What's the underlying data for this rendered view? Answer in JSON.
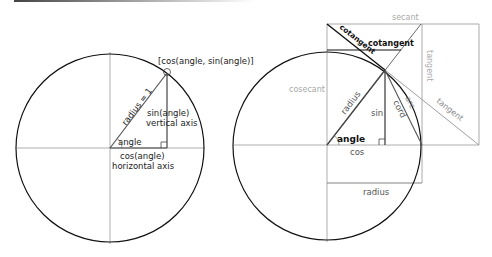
{
  "header": {
    "rule_gradient_start": "#444444",
    "rule_gradient_end": "#ffffff"
  },
  "left_diagram": {
    "labels": {
      "point": "[cos(angle, sin(angle)]",
      "radius": "radius = 1",
      "sin_line1": "sin(angle)",
      "sin_line2": "vertical axis",
      "angle": "angle",
      "cos_line1": "cos(angle)",
      "cos_line2": "horizontal axis"
    }
  },
  "right_diagram": {
    "labels": {
      "secant": "secant",
      "cotangent_diag": "cotangent",
      "cotangent_horiz": "cotangent",
      "cosecant": "cosecant",
      "tangent_vertical": "tangent",
      "tangent_diag": "tangent",
      "radius_diag": "radius",
      "sin": "sin",
      "cord": "cord",
      "arc": "arc",
      "angle": "angle",
      "cos": "cos",
      "radius_box": "radius"
    }
  },
  "colors": {
    "circle": "#111111",
    "axis": "#9a9a9a",
    "dark_line": "#444444",
    "light_line": "#a0a0a0",
    "text_dark": "#222222",
    "text_grey": "#a8a8a8"
  }
}
